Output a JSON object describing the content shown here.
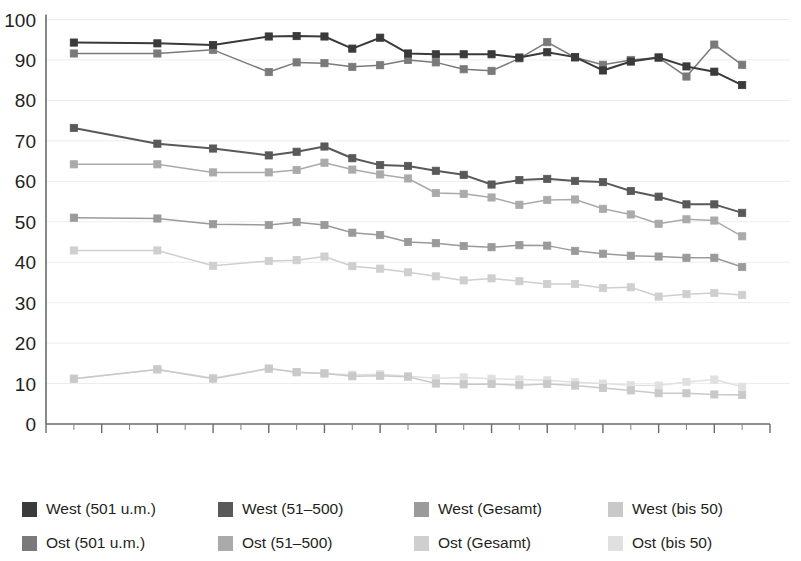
{
  "chart_data": {
    "type": "line",
    "title": "",
    "subtitle": "",
    "xlabel": "",
    "ylabel": "",
    "xlim": [
      1992,
      2018
    ],
    "ylim": [
      0,
      100
    ],
    "grid": true,
    "grid_axis": "y",
    "legend_position": "bottom",
    "legend_columns": 4,
    "x_tick_labels": [
      "1992",
      "1994",
      "1996",
      "1998",
      "2000",
      "2002",
      "2004",
      "2006",
      "2008",
      "2010",
      "2012",
      "2014",
      "2016",
      "2018"
    ],
    "x_tick_values": [
      1992,
      1994,
      1996,
      1998,
      2000,
      2002,
      2004,
      2006,
      2008,
      2010,
      2012,
      2014,
      2016,
      2018
    ],
    "x_minor_tick_values": [
      1993,
      1995,
      1997,
      1999,
      2001,
      2003,
      2005,
      2007,
      2009,
      2011,
      2013,
      2015,
      2017
    ],
    "y_tick_labels": [
      "0",
      "10",
      "20",
      "30",
      "40",
      "50",
      "60",
      "70",
      "80",
      "90",
      "100"
    ],
    "y_tick_values": [
      0,
      10,
      20,
      30,
      40,
      50,
      60,
      70,
      80,
      90,
      100
    ],
    "x": [
      1993,
      1996,
      1998,
      2000,
      2001,
      2002,
      2003,
      2004,
      2005,
      2006,
      2007,
      2008,
      2009,
      2010,
      2011,
      2012,
      2013,
      2014,
      2015,
      2016,
      2017
    ],
    "series": [
      {
        "name": "West (501 u.m.)",
        "color": "#3a3a3a",
        "values": [
          94.3,
          94.1,
          93.7,
          95.8,
          95.9,
          95.8,
          92.8,
          95.5,
          91.6,
          91.4,
          91.4,
          91.4,
          90.6,
          91.9,
          90.7,
          87.4,
          89.6,
          90.6,
          88.4,
          87.1,
          83.8
        ]
      },
      {
        "name": "West (51-500)",
        "color": "#595959",
        "values": [
          73.2,
          69.3,
          68.1,
          66.4,
          67.3,
          68.6,
          65.7,
          64.0,
          63.8,
          62.6,
          61.6,
          59.2,
          60.3,
          60.6,
          60.1,
          59.8,
          57.6,
          56.2,
          54.3,
          54.3,
          52.2
        ]
      },
      {
        "name": "West (Gesamt)",
        "color": "#9a9a9a",
        "values": [
          51.0,
          50.8,
          49.4,
          49.2,
          49.9,
          49.2,
          47.3,
          46.7,
          45.0,
          44.7,
          44.0,
          43.7,
          44.2,
          44.1,
          42.8,
          42.1,
          41.6,
          41.4,
          41.1,
          41.1,
          38.8
        ]
      },
      {
        "name": "West (bis 50)",
        "color": "#c9c9c9",
        "values": [
          11.2,
          13.5,
          11.2,
          13.7,
          12.8,
          12.5,
          11.8,
          11.9,
          11.7,
          10.0,
          9.8,
          9.9,
          9.6,
          9.9,
          9.5,
          8.9,
          8.3,
          7.6,
          7.6,
          7.3,
          7.2
        ]
      },
      {
        "name": "Ost (501 u.m.)",
        "color": "#7a7a7a",
        "values": [
          91.6,
          91.6,
          92.5,
          87.0,
          89.4,
          89.2,
          88.3,
          88.7,
          90.0,
          89.4,
          87.7,
          87.3,
          90.4,
          94.4,
          90.6,
          88.8,
          90.0,
          90.6,
          85.9,
          93.8,
          88.8
        ]
      },
      {
        "name": "Ost (51-500)",
        "color": "#aaaaaa",
        "values": [
          64.2,
          64.2,
          62.2,
          62.2,
          62.8,
          64.6,
          62.9,
          61.7,
          60.7,
          57.1,
          56.9,
          56.0,
          54.2,
          55.4,
          55.5,
          53.2,
          51.8,
          49.5,
          50.6,
          50.3,
          46.4
        ]
      },
      {
        "name": "Ost (Gesamt)",
        "color": "#cfcfcf",
        "values": [
          42.9,
          42.9,
          39.1,
          40.3,
          40.5,
          41.4,
          39.0,
          38.4,
          37.5,
          36.5,
          35.5,
          36.0,
          35.3,
          34.6,
          34.6,
          33.6,
          33.8,
          31.5,
          32.1,
          32.4,
          31.9
        ]
      },
      {
        "name": "Ost (bis 50)",
        "color": "#e0e0e0",
        "values": [
          11.2,
          13.5,
          11.4,
          13.7,
          12.8,
          12.5,
          12.2,
          12.3,
          11.8,
          11.3,
          11.5,
          11.2,
          11.0,
          10.8,
          10.3,
          10.0,
          9.6,
          9.5,
          10.4,
          11.0,
          9.2
        ]
      }
    ]
  },
  "legend": {
    "items": [
      {
        "label": "West (501 u.m.)",
        "swatch": "#3a3a3a",
        "row": 0,
        "col": 0
      },
      {
        "label": "West (51–500)",
        "swatch": "#595959",
        "row": 0,
        "col": 1
      },
      {
        "label": "West (Gesamt)",
        "swatch": "#9a9a9a",
        "row": 0,
        "col": 2
      },
      {
        "label": "West (bis 50)",
        "swatch": "#c9c9c9",
        "row": 0,
        "col": 3
      },
      {
        "label": "Ost (501 u.m.)",
        "swatch": "#7a7a7a",
        "row": 1,
        "col": 0
      },
      {
        "label": "Ost (51–500)",
        "swatch": "#aaaaaa",
        "row": 1,
        "col": 1
      },
      {
        "label": "Ost (Gesamt)",
        "swatch": "#cfcfcf",
        "row": 1,
        "col": 2
      },
      {
        "label": "Ost (bis 50)",
        "swatch": "#e0e0e0",
        "row": 1,
        "col": 3
      }
    ]
  }
}
